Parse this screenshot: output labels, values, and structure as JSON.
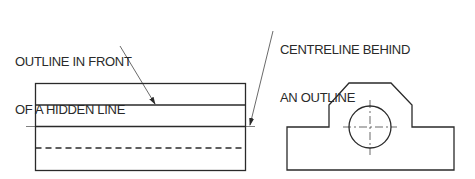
{
  "annotations": {
    "left_label_line1": "OUTLINE IN FRONT",
    "left_label_line2": "OF A HIDDEN LINE",
    "right_label_line1": "CENTRELINE BEHIND",
    "right_label_line2": "AN OUTLINE"
  },
  "colors": {
    "line": "#2a2a2a",
    "background": "#ffffff"
  },
  "views": [
    {
      "name": "front-view",
      "lines": [
        "outline",
        "outline",
        "centreline",
        "hidden-line"
      ]
    },
    {
      "name": "side-view",
      "features": [
        "stepped-profile",
        "circular-hole",
        "centre-mark"
      ]
    }
  ]
}
